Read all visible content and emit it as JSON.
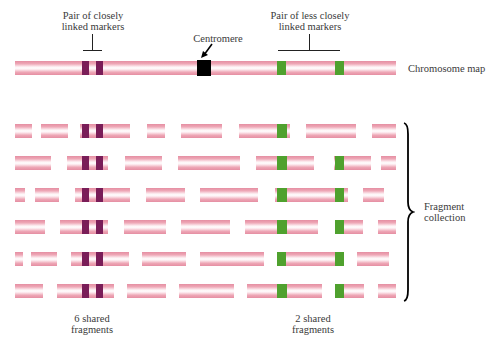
{
  "labels": {
    "close_pair": [
      "Pair of closely",
      "linked markers"
    ],
    "centromere": "Centromere",
    "less_close_pair": [
      "Pair of less closely",
      "linked markers"
    ],
    "chromosome_map": "Chromosome map",
    "fragment_collection": [
      "Fragment",
      "collection"
    ],
    "six_shared": [
      "6 shared",
      "fragments"
    ],
    "two_shared": [
      "2 shared",
      "fragments"
    ]
  },
  "colors": {
    "chromosome_pink": "#e58ea2",
    "close_marker": "#7a1d58",
    "far_marker": "#4fa12e",
    "centromere": "#000000"
  },
  "chromosome_map": {
    "x": 15,
    "width": 381,
    "y": 61,
    "markers": [
      {
        "type": "purple",
        "x": 82,
        "w": 7
      },
      {
        "type": "purple",
        "x": 96,
        "w": 7
      },
      {
        "type": "black",
        "x": 197,
        "w": 14
      },
      {
        "type": "green",
        "x": 277,
        "w": 9
      },
      {
        "type": "green",
        "x": 335,
        "w": 9
      }
    ]
  },
  "fragment_rows": [
    {
      "y": 124,
      "fragments": [
        [
          15,
          32
        ],
        [
          41,
          68
        ],
        [
          80,
          130
        ],
        [
          147,
          165
        ],
        [
          181,
          222
        ],
        [
          239,
          290
        ],
        [
          306,
          356
        ],
        [
          372,
          396
        ]
      ],
      "markers": [
        [
          "purple",
          82,
          89
        ],
        [
          "purple",
          96,
          103
        ],
        [
          "green",
          277,
          287
        ]
      ]
    },
    {
      "y": 156,
      "fragments": [
        [
          15,
          51
        ],
        [
          67,
          108
        ],
        [
          125,
          162
        ],
        [
          178,
          240
        ],
        [
          256,
          314
        ],
        [
          334,
          371
        ],
        [
          381,
          396
        ]
      ],
      "markers": [
        [
          "purple",
          82,
          89
        ],
        [
          "purple",
          96,
          103
        ],
        [
          "green",
          277,
          287
        ],
        [
          "green",
          335,
          344
        ]
      ]
    },
    {
      "y": 188,
      "fragments": [
        [
          15,
          25
        ],
        [
          35,
          59
        ],
        [
          75,
          130
        ],
        [
          146,
          185
        ],
        [
          200,
          258
        ],
        [
          275,
          348
        ],
        [
          363,
          384
        ]
      ],
      "markers": [
        [
          "purple",
          82,
          89
        ],
        [
          "purple",
          96,
          103
        ],
        [
          "green",
          277,
          287
        ],
        [
          "green",
          335,
          344
        ]
      ]
    },
    {
      "y": 220,
      "fragments": [
        [
          15,
          45
        ],
        [
          60,
          108
        ],
        [
          124,
          166
        ],
        [
          181,
          230
        ],
        [
          245,
          318
        ],
        [
          335,
          363
        ],
        [
          378,
          396
        ]
      ],
      "markers": [
        [
          "purple",
          82,
          89
        ],
        [
          "purple",
          96,
          103
        ],
        [
          "green",
          277,
          287
        ],
        [
          "green",
          335,
          344
        ]
      ]
    },
    {
      "y": 252,
      "fragments": [
        [
          15,
          23
        ],
        [
          31,
          57
        ],
        [
          71,
          129
        ],
        [
          142,
          186
        ],
        [
          200,
          264
        ],
        [
          277,
          343
        ],
        [
          357,
          389
        ]
      ],
      "markers": [
        [
          "purple",
          82,
          89
        ],
        [
          "purple",
          96,
          103
        ],
        [
          "green",
          277,
          286
        ],
        [
          "green",
          335,
          344
        ]
      ]
    },
    {
      "y": 284,
      "fragments": [
        [
          15,
          43
        ],
        [
          57,
          114
        ],
        [
          127,
          166
        ],
        [
          179,
          234
        ],
        [
          247,
          322
        ],
        [
          335,
          364
        ],
        [
          378,
          396
        ]
      ],
      "markers": [
        [
          "purple",
          82,
          89
        ],
        [
          "purple",
          96,
          103
        ],
        [
          "green",
          277,
          287
        ],
        [
          "green",
          335,
          344
        ]
      ]
    }
  ]
}
